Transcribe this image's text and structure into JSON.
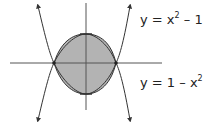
{
  "diagram": {
    "curves": [
      {
        "name": "upper-curve",
        "label_base": "y = x",
        "label_exp": "2",
        "label_tail": " – 1",
        "equation": "y = x^2 - 1"
      },
      {
        "name": "lower-curve",
        "label_base": "y = 1 – x",
        "label_exp": "2",
        "label_tail": "",
        "equation": "y = 1 - x^2"
      }
    ],
    "intersections": [
      [
        -1,
        0
      ],
      [
        1,
        0
      ]
    ],
    "colors": {
      "fill": "#b3b3b3",
      "stroke": "#333333",
      "axis": "#555555"
    }
  }
}
